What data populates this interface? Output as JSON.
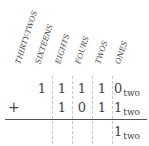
{
  "column_headers": [
    "THIRTY-TWOS",
    "SIXTEENS",
    "EIGHTS",
    "FOURS",
    "TWOS",
    "ONES"
  ],
  "rows": {
    "addend1": {
      "digits": [
        "1",
        "1",
        "1",
        "1",
        "0"
      ],
      "base": "two"
    },
    "addend2": {
      "operator": "+",
      "digits": [
        "1",
        "0",
        "1",
        "1"
      ],
      "base": "two"
    },
    "sum": {
      "digits": [
        "1"
      ],
      "base": "two"
    }
  }
}
